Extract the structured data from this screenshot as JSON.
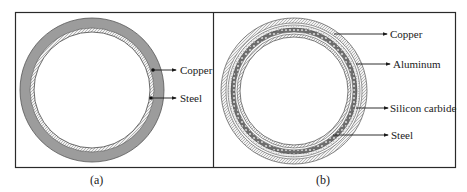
{
  "figure": {
    "panel_a": {
      "caption": "(a)",
      "layers": [
        {
          "name": "Copper",
          "label": "Copper"
        },
        {
          "name": "Steel",
          "label": "Steel"
        }
      ]
    },
    "panel_b": {
      "caption": "(b)",
      "layers": [
        {
          "name": "Copper",
          "label": "Copper"
        },
        {
          "name": "Aluminum",
          "label": "Aluminum"
        },
        {
          "name": "Silicon carbide",
          "label": "Silicon carbide"
        },
        {
          "name": "Steel",
          "label": "Steel"
        }
      ]
    },
    "colors": {
      "border": "#2a2a2a",
      "copper_fill": "#9a9a9a",
      "steel_fill": "#e6e6e6",
      "text": "#1a1a1a"
    }
  }
}
